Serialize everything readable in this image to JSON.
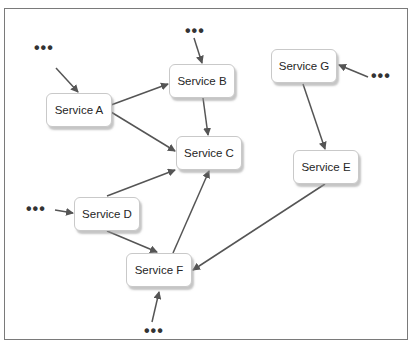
{
  "diagram": {
    "type": "service-dependency-graph",
    "nodes": [
      {
        "id": "A",
        "label": "Service A",
        "x": 46,
        "y": 93
      },
      {
        "id": "B",
        "label": "Service B",
        "x": 169,
        "y": 64
      },
      {
        "id": "C",
        "label": "Service C",
        "x": 176,
        "y": 136
      },
      {
        "id": "D",
        "label": "Service D",
        "x": 74,
        "y": 197
      },
      {
        "id": "E",
        "label": "Service E",
        "x": 293,
        "y": 150
      },
      {
        "id": "F",
        "label": "Service F",
        "x": 126,
        "y": 253
      },
      {
        "id": "G",
        "label": "Service G",
        "x": 271,
        "y": 49
      }
    ],
    "edges": [
      {
        "from": "...",
        "to": "A"
      },
      {
        "from": "...",
        "to": "B"
      },
      {
        "from": "...",
        "to": "G"
      },
      {
        "from": "...",
        "to": "D"
      },
      {
        "from": "...",
        "to": "F"
      },
      {
        "from": "A",
        "to": "B"
      },
      {
        "from": "A",
        "to": "C"
      },
      {
        "from": "B",
        "to": "C"
      },
      {
        "from": "D",
        "to": "C"
      },
      {
        "from": "D",
        "to": "F"
      },
      {
        "from": "F",
        "to": "C"
      },
      {
        "from": "G",
        "to": "E"
      },
      {
        "from": "E",
        "to": "F"
      }
    ],
    "ellipsis_label": "•••",
    "colors": {
      "edge": "#555555",
      "node_border": "#c9c9c9",
      "frame": "#7a7a7a"
    }
  }
}
